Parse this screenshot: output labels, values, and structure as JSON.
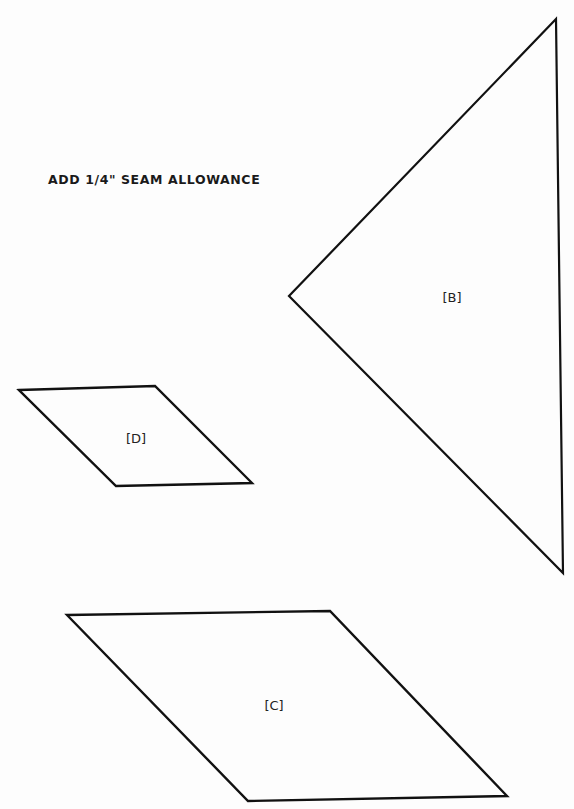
{
  "page": {
    "instruction": "ADD 1/4\" SEAM ALLOWANCE",
    "line_color": "#111111",
    "background": "#fdfdfd"
  },
  "pieces": [
    {
      "id": "B",
      "label": "[B]",
      "shape": "triangle",
      "points": [
        [
          556,
          19
        ],
        [
          289,
          296
        ],
        [
          563,
          573
        ]
      ],
      "label_pos": [
        452,
        297
      ]
    },
    {
      "id": "D",
      "label": "[D]",
      "shape": "parallelogram",
      "points": [
        [
          19,
          390
        ],
        [
          155,
          386
        ],
        [
          252,
          483
        ],
        [
          116,
          486
        ]
      ],
      "label_pos": [
        136,
        438
      ]
    },
    {
      "id": "C",
      "label": "[C]",
      "shape": "parallelogram",
      "points": [
        [
          67,
          615
        ],
        [
          330,
          611
        ],
        [
          507,
          796
        ],
        [
          248,
          801
        ]
      ],
      "label_pos": [
        274,
        705
      ]
    }
  ]
}
